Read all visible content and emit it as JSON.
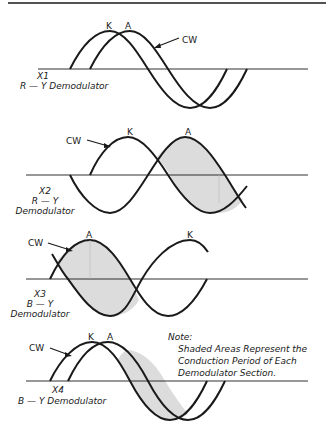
{
  "figure": {
    "panels": [
      {
        "id": "X1",
        "demodulator": "R — Y Demodulator",
        "label_x": "X1",
        "peak_labels": [
          "K",
          "A"
        ],
        "cw_label": "CW",
        "shaded": false
      },
      {
        "id": "X2",
        "label_x": "X2",
        "label_line2": "R — Y",
        "label_line3": "Demodulator",
        "peak_labels": [
          "K",
          "A"
        ],
        "cw_label": "CW",
        "shaded": true
      },
      {
        "id": "X3",
        "label_x": "X3",
        "label_line2": "B — Y",
        "label_line3": "Demodulator",
        "peak_labels": [
          "A",
          "K"
        ],
        "cw_label": "CW",
        "shaded": true
      },
      {
        "id": "X4",
        "demodulator": "B — Y Demodulator",
        "label_x": "X4",
        "peak_labels": [
          "K",
          "A"
        ],
        "cw_label": "CW",
        "shaded": true
      }
    ],
    "note": {
      "heading": "Note:",
      "lines": [
        "Shaded Areas Represent the",
        "Conduction Period of Each",
        "Demodulator Section."
      ]
    },
    "colors": {
      "line": "#1a1a1a",
      "shade": "#dcdcdc"
    }
  }
}
